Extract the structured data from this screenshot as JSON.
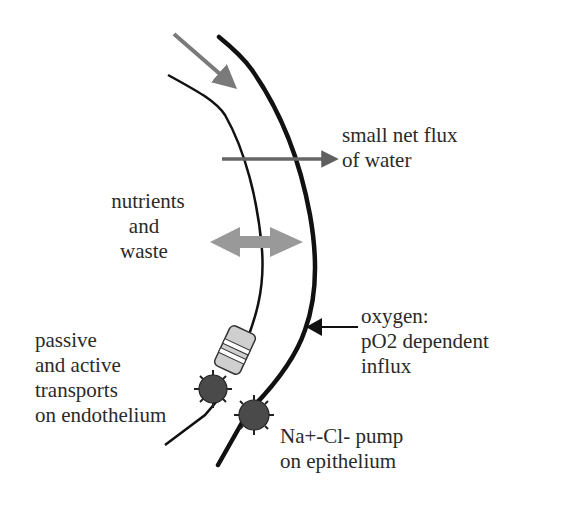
{
  "labels": {
    "water_flux": [
      "small net flux",
      "of water"
    ],
    "nutrients": [
      "nutrients",
      "and",
      "waste"
    ],
    "oxygen": [
      "oxygen:",
      "pO2 dependent",
      "influx"
    ],
    "transports": [
      "passive",
      "and active",
      "transports",
      "on endothelium"
    ],
    "pump": [
      "Na+-Cl- pump",
      "on epithelium"
    ]
  },
  "colors": {
    "membrane": "#111111",
    "flow_arrow": "#7a7a7a",
    "water_arrow": "#666666",
    "exchange_arrow": "#999999",
    "channel_fill": "#cfcfcf",
    "pump_fill": "#4a4a4a",
    "text": "#2a2a2a"
  }
}
